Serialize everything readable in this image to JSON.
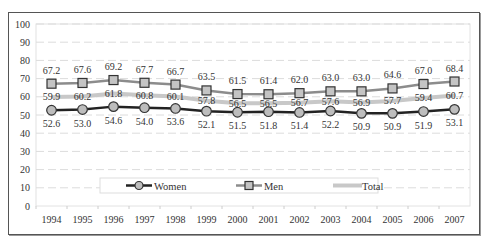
{
  "chart_data": {
    "type": "line",
    "title": "",
    "xlabel": "",
    "ylabel": "",
    "ylim": [
      0,
      100
    ],
    "yticks": [
      0,
      10,
      20,
      30,
      40,
      50,
      60,
      70,
      80,
      90,
      100
    ],
    "grid": true,
    "legend_position": "bottom-inside",
    "categories": [
      "1994",
      "1995",
      "1996",
      "1997",
      "1998",
      "1999",
      "2000",
      "2001",
      "2002",
      "2003",
      "2004",
      "2005",
      "2006",
      "2007"
    ],
    "series": [
      {
        "name": "Women",
        "marker": "circle",
        "color": "#222222",
        "values": [
          52.6,
          53.0,
          54.6,
          54.0,
          53.6,
          52.1,
          51.5,
          51.8,
          51.4,
          52.2,
          50.9,
          50.9,
          51.9,
          53.1
        ]
      },
      {
        "name": "Men",
        "marker": "square",
        "color": "#888888",
        "values": [
          67.2,
          67.6,
          69.2,
          67.7,
          66.7,
          63.5,
          61.5,
          61.4,
          62.0,
          63.0,
          63.0,
          64.6,
          67.0,
          68.4
        ]
      },
      {
        "name": "Total",
        "marker": "none",
        "color": "#cccccc",
        "values": [
          59.9,
          60.2,
          61.8,
          60.8,
          60.1,
          57.8,
          56.5,
          56.5,
          56.7,
          57.6,
          56.9,
          57.7,
          59.4,
          60.7
        ]
      }
    ]
  },
  "legend": {
    "women": "Women",
    "men": "Men",
    "total": "Total"
  }
}
